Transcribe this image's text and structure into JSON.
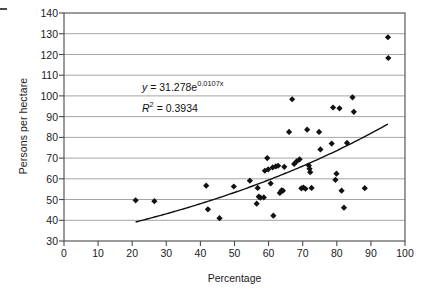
{
  "chart_data": {
    "type": "scatter",
    "title": "",
    "xlabel": "Percentage",
    "ylabel": "Persons per hectare",
    "xlim": [
      0,
      100
    ],
    "ylim": [
      30,
      140
    ],
    "xticks": [
      0,
      10,
      20,
      30,
      40,
      50,
      60,
      70,
      80,
      90,
      100
    ],
    "yticks": [
      30,
      40,
      50,
      60,
      70,
      80,
      90,
      100,
      110,
      120,
      130,
      140
    ],
    "grid": "horizontal",
    "legend": "none",
    "marker": "diamond",
    "marker_color": "#111111",
    "points": [
      [
        21.0,
        49.6
      ],
      [
        26.5,
        49.2
      ],
      [
        41.7,
        56.7
      ],
      [
        42.2,
        45.3
      ],
      [
        45.6,
        41.0
      ],
      [
        49.8,
        56.3
      ],
      [
        54.5,
        59.1
      ],
      [
        56.5,
        48.0
      ],
      [
        56.8,
        55.6
      ],
      [
        57.1,
        51.4
      ],
      [
        57.6,
        50.9
      ],
      [
        58.6,
        51.0
      ],
      [
        58.9,
        63.9
      ],
      [
        59.6,
        70.0
      ],
      [
        59.9,
        64.6
      ],
      [
        60.6,
        57.8
      ],
      [
        61.2,
        65.5
      ],
      [
        61.4,
        42.2
      ],
      [
        62.1,
        66.0
      ],
      [
        62.8,
        66.3
      ],
      [
        63.3,
        53.2
      ],
      [
        63.8,
        54.4
      ],
      [
        64.2,
        54.3
      ],
      [
        64.6,
        65.8
      ],
      [
        66.0,
        82.6
      ],
      [
        66.9,
        98.4
      ],
      [
        67.5,
        67.2
      ],
      [
        68.2,
        68.4
      ],
      [
        69.1,
        69.4
      ],
      [
        69.6,
        55.4
      ],
      [
        70.2,
        55.8
      ],
      [
        70.8,
        55.2
      ],
      [
        71.3,
        83.7
      ],
      [
        71.8,
        66.4
      ],
      [
        72.0,
        64.8
      ],
      [
        72.2,
        63.2
      ],
      [
        72.6,
        55.6
      ],
      [
        74.8,
        82.6
      ],
      [
        75.2,
        74.2
      ],
      [
        78.5,
        77.0
      ],
      [
        78.9,
        94.4
      ],
      [
        79.6,
        59.5
      ],
      [
        79.9,
        62.5
      ],
      [
        80.8,
        94.0
      ],
      [
        81.4,
        54.3
      ],
      [
        82.1,
        46.1
      ],
      [
        83.0,
        77.3
      ],
      [
        84.6,
        99.3
      ],
      [
        85.0,
        92.3
      ],
      [
        88.2,
        55.5
      ],
      [
        95.0,
        128.3
      ],
      [
        95.1,
        118.3
      ]
    ],
    "trendline": {
      "kind": "exponential",
      "equation_y": "y",
      "equation_eq": "=",
      "equation_coef": "31.278e",
      "equation_exp": "0.0107x",
      "r2_symbol": "R",
      "r2_sup": "2",
      "r2_eq": "=",
      "r2_value": "0.3934",
      "coefficient": 31.278,
      "rate": 0.0107,
      "r_squared": 0.3934,
      "x_start": 21,
      "x_end": 95,
      "color": "#111111"
    },
    "axis_color": "#4a4a4a",
    "grid_color": "#9a9a9a"
  }
}
